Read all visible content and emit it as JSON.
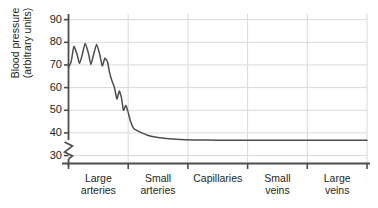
{
  "chart_data": {
    "type": "line",
    "title": "",
    "xlabel": "",
    "ylabel_lines": [
      "Blood pressure",
      "(arbitrary units)"
    ],
    "ylabel": "Blood pressure (arbitrary units)",
    "ylim": [
      25,
      92
    ],
    "yticks": [
      30,
      40,
      50,
      60,
      70,
      80,
      90
    ],
    "ytick_labels": [
      "30",
      "40",
      "50",
      "60",
      "70",
      "80",
      "90"
    ],
    "y_axis_break": true,
    "y_axis_break_symbol": "zigzag",
    "grid": true,
    "grid_color": "#d9d9d9",
    "legend": "none",
    "line_color": "#4d4d4d",
    "axis_color": "#4d4d4d",
    "categories": [
      "Large arteries",
      "Small arteries",
      "Capillaries",
      "Small veins",
      "Large veins"
    ],
    "category_lines": [
      [
        "Large",
        "arteries"
      ],
      [
        "Small",
        "arteries"
      ],
      [
        "Capillaries",
        ""
      ],
      [
        "Small",
        "veins"
      ],
      [
        "Large",
        "veins"
      ]
    ],
    "series": [
      {
        "name": "Blood pressure",
        "description": "Pulsatile pressure in arteries damping to steady low pressure in capillaries and veins",
        "points": [
          {
            "x": 0.0,
            "y": 69.0
          },
          {
            "x": 0.9,
            "y": 71.5
          },
          {
            "x": 1.8,
            "y": 78.2
          },
          {
            "x": 2.9,
            "y": 74.5
          },
          {
            "x": 3.7,
            "y": 70.6
          },
          {
            "x": 4.6,
            "y": 74.5
          },
          {
            "x": 5.6,
            "y": 79.6
          },
          {
            "x": 6.7,
            "y": 75.0
          },
          {
            "x": 7.5,
            "y": 70.2
          },
          {
            "x": 8.4,
            "y": 74.5
          },
          {
            "x": 9.4,
            "y": 79.2
          },
          {
            "x": 10.5,
            "y": 74.5
          },
          {
            "x": 11.3,
            "y": 69.6
          },
          {
            "x": 12.2,
            "y": 73.0
          },
          {
            "x": 13.1,
            "y": 71.2
          },
          {
            "x": 13.8,
            "y": 66.4
          },
          {
            "x": 14.6,
            "y": 62.8
          },
          {
            "x": 15.4,
            "y": 60.0
          },
          {
            "x": 16.2,
            "y": 55.0
          },
          {
            "x": 17.0,
            "y": 58.5
          },
          {
            "x": 17.7,
            "y": 55.8
          },
          {
            "x": 18.4,
            "y": 50.0
          },
          {
            "x": 19.2,
            "y": 52.2
          },
          {
            "x": 19.9,
            "y": 49.5
          },
          {
            "x": 20.8,
            "y": 45.0
          },
          {
            "x": 21.8,
            "y": 42.0
          },
          {
            "x": 23.0,
            "y": 41.0
          },
          {
            "x": 24.5,
            "y": 40.0
          },
          {
            "x": 26.5,
            "y": 39.0
          },
          {
            "x": 29.0,
            "y": 38.2
          },
          {
            "x": 32.0,
            "y": 37.6
          },
          {
            "x": 36.0,
            "y": 37.2
          },
          {
            "x": 42.0,
            "y": 36.9
          },
          {
            "x": 50.0,
            "y": 36.8
          },
          {
            "x": 60.0,
            "y": 36.8
          },
          {
            "x": 72.0,
            "y": 36.8
          },
          {
            "x": 85.0,
            "y": 36.8
          },
          {
            "x": 100.0,
            "y": 36.8
          }
        ]
      }
    ]
  }
}
